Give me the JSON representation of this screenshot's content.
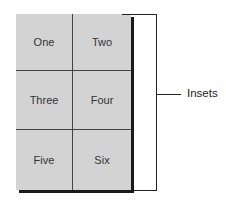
{
  "diagram": {
    "type": "inset-grid",
    "grid": {
      "rows": 3,
      "columns": 2,
      "cells": [
        {
          "label": "One"
        },
        {
          "label": "Two"
        },
        {
          "label": "Three"
        },
        {
          "label": "Four"
        },
        {
          "label": "Five"
        },
        {
          "label": "Six"
        }
      ]
    },
    "bracket_label": "Insets",
    "colors": {
      "panel": "#d3d3d3",
      "shadow": "#1a1a1a",
      "lines": "#444444",
      "bracket": "#222222",
      "background": "#ffffff"
    }
  }
}
